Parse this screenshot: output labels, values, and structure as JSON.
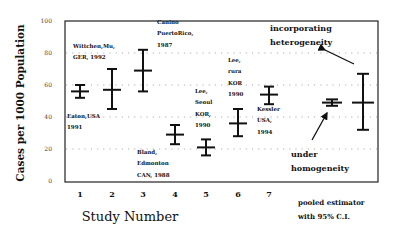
{
  "chart_data": {
    "type": "scatter",
    "subtype": "error-bar",
    "title": "",
    "xlabel": "Study Number",
    "ylabel": "Cases per 1000 Population",
    "ylim": [
      0,
      100
    ],
    "yticks": [
      0,
      20,
      40,
      60,
      80,
      100
    ],
    "ytick_labels": [
      "0",
      "20",
      "40",
      "60",
      "80",
      "100"
    ],
    "grid": "horizontal dotted at 20, 40, 60, 80",
    "categories": [
      "1",
      "2",
      "3",
      "4",
      "5",
      "6",
      "7",
      "",
      ""
    ],
    "series": [
      {
        "name": "Individual studies",
        "points": [
          {
            "study": "1",
            "estimate": 56,
            "lower": 52,
            "upper": 60,
            "annotation": [
              "Eaton,USA",
              "1991"
            ]
          },
          {
            "study": "2",
            "estimate": 57,
            "lower": 45,
            "upper": 70,
            "annotation": [
              "Wittchen,Mu,",
              "GER, 1992"
            ]
          },
          {
            "study": "3",
            "estimate": 69,
            "lower": 56,
            "upper": 82,
            "annotation": [
              "Canino",
              "PuertoRico,",
              "1987"
            ]
          },
          {
            "study": "4",
            "estimate": 29,
            "lower": 23,
            "upper": 35,
            "annotation": [
              "Bland,",
              "Edmonton",
              "CAN, 1988"
            ]
          },
          {
            "study": "5",
            "estimate": 21,
            "lower": 16,
            "upper": 26,
            "annotation": [
              "Lee,",
              "Seoul",
              "KOR,",
              "1990"
            ]
          },
          {
            "study": "6",
            "estimate": 36,
            "lower": 28,
            "upper": 45,
            "annotation": [
              "Lee,",
              "rura",
              "KOR",
              "1990"
            ]
          },
          {
            "study": "7",
            "estimate": 54,
            "lower": 48,
            "upper": 59,
            "annotation": [
              "Kessler",
              "USA,",
              "1994"
            ]
          }
        ]
      },
      {
        "name": "Pooled estimator with 95% C.I.",
        "points": [
          {
            "label": "under homogeneity",
            "estimate": 49,
            "lower": 47,
            "upper": 51
          },
          {
            "label": "incorporating heterogeneity",
            "estimate": 49,
            "lower": 32,
            "upper": 67
          }
        ]
      }
    ],
    "annotations": {
      "heterogeneity": [
        "incorporating",
        "heterogeneity"
      ],
      "homogeneity": [
        "under",
        "homogeneity"
      ],
      "pooled_label": [
        "pooled estimator",
        "with 95% C.I."
      ]
    }
  }
}
